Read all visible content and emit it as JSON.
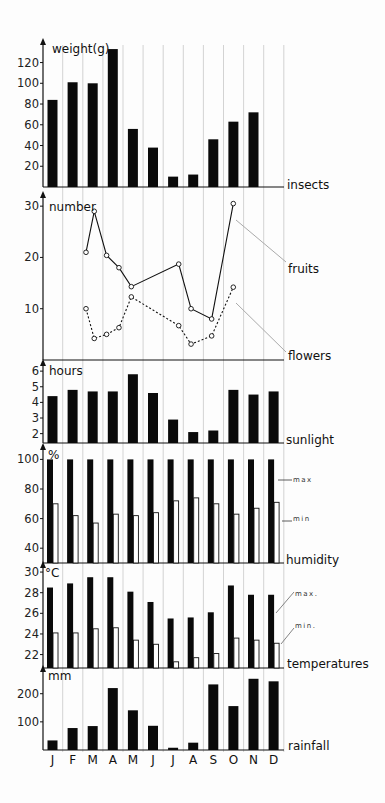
{
  "months": [
    "J",
    "F",
    "M",
    "A",
    "M",
    "J",
    "J",
    "A",
    "S",
    "O",
    "N",
    "D"
  ],
  "chart_data": [
    {
      "type": "bar",
      "name": "insects",
      "ylabel": "weight(g)",
      "series_label": "insects",
      "yticks": [
        20,
        40,
        60,
        80,
        100,
        120
      ],
      "ylim": [
        0,
        135
      ],
      "categories": [
        "J",
        "F",
        "M",
        "A",
        "M",
        "J",
        "J",
        "A",
        "S",
        "O",
        "N",
        "D"
      ],
      "values": [
        84,
        101,
        100,
        133,
        56,
        38,
        10,
        12,
        46,
        63,
        72,
        null
      ]
    },
    {
      "type": "line",
      "name": "fruits-flowers",
      "ylabel": "number",
      "yticks": [
        10,
        20,
        30
      ],
      "ylim": [
        0,
        31
      ],
      "series": [
        {
          "name": "fruits",
          "style": "solid",
          "x": [
            2.0,
            2.4,
            3.0,
            3.6,
            4.2,
            6.5,
            7.1,
            8.1,
            9.15
          ],
          "values": [
            21,
            29,
            20.4,
            18,
            14.3,
            18.7,
            10,
            8,
            30.5
          ]
        },
        {
          "name": "flowers",
          "style": "dashed",
          "x": [
            2.0,
            2.4,
            3.0,
            3.6,
            4.2,
            6.5,
            7.1,
            8.1,
            9.15
          ],
          "values": [
            10,
            4.2,
            5,
            6.3,
            12.3,
            6.7,
            3.1,
            4.7,
            14.2
          ]
        }
      ]
    },
    {
      "type": "bar",
      "name": "sunlight",
      "ylabel": "hours",
      "series_label": "sunlight",
      "yticks": [
        2,
        3,
        4,
        5,
        6
      ],
      "ylim": [
        1.4,
        6.2
      ],
      "categories": [
        "J",
        "F",
        "M",
        "A",
        "M",
        "J",
        "J",
        "A",
        "S",
        "O",
        "N",
        "D"
      ],
      "values": [
        4.4,
        4.8,
        4.7,
        4.7,
        5.8,
        4.6,
        2.9,
        2.1,
        2.2,
        4.8,
        4.5,
        4.7
      ]
    },
    {
      "type": "bar",
      "name": "humidity",
      "ylabel": "%",
      "series_label": "humidity",
      "yticks": [
        40,
        60,
        80,
        100
      ],
      "ylim": [
        30,
        105
      ],
      "categories": [
        "J",
        "F",
        "M",
        "A",
        "M",
        "J",
        "J",
        "A",
        "S",
        "O",
        "N",
        "D"
      ],
      "series": [
        {
          "name": "max",
          "values": [
            100,
            100,
            100,
            100,
            100,
            100,
            100,
            100,
            100,
            100,
            100,
            100
          ]
        },
        {
          "name": "min",
          "values": [
            70,
            62,
            57,
            63,
            62,
            64,
            72,
            74,
            70,
            63,
            67,
            71
          ]
        }
      ]
    },
    {
      "type": "bar",
      "name": "temperatures",
      "ylabel": "°C",
      "series_label": "temperatures",
      "yticks": [
        22,
        24,
        26,
        28,
        30
      ],
      "ylim": [
        20.7,
        30.2
      ],
      "categories": [
        "J",
        "F",
        "M",
        "A",
        "M",
        "J",
        "J",
        "A",
        "S",
        "O",
        "N",
        "D"
      ],
      "series": [
        {
          "name": "max",
          "values": [
            28.5,
            28.9,
            29.5,
            29.5,
            28.1,
            27.1,
            25.5,
            25.6,
            26.1,
            28.7,
            27.8,
            27.8
          ]
        },
        {
          "name": "min",
          "values": [
            24.1,
            24.1,
            24.5,
            24.6,
            23.4,
            23.0,
            21.3,
            21.7,
            22.1,
            23.6,
            23.4,
            23.1
          ]
        }
      ]
    },
    {
      "type": "bar",
      "name": "rainfall",
      "ylabel": "mm",
      "series_label": "rainfall",
      "yticks": [
        100,
        200
      ],
      "ylim": [
        0,
        270
      ],
      "categories": [
        "J",
        "F",
        "M",
        "A",
        "M",
        "J",
        "J",
        "A",
        "S",
        "O",
        "N",
        "D"
      ],
      "values": [
        34,
        78,
        85,
        220,
        141,
        86,
        8,
        26,
        233,
        156,
        253,
        244
      ]
    }
  ],
  "labels": {
    "insects_axis": "weight(g)",
    "insects": "insects",
    "number_axis": "number",
    "fruits": "fruits",
    "flowers": "flowers",
    "hours_axis": "hours",
    "sunlight": "sunlight",
    "humidity_axis": "%",
    "humidity": "humidity",
    "max": "max",
    "min": "min",
    "temp_axis": "°C",
    "temperatures": "temperatures",
    "max_t": "max.",
    "min_t": "min.",
    "rain_axis": "mm",
    "rainfall": "rainfall"
  }
}
